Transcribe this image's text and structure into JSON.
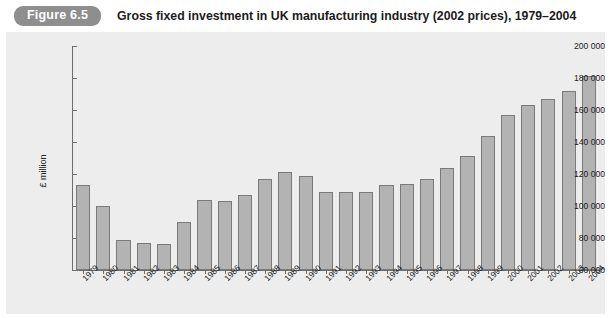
{
  "header": {
    "badge": "Figure 6.5",
    "title": "Gross fixed investment in UK manufacturing industry (2002 prices), 1979–2004"
  },
  "colors": {
    "badge_bg": "#8e8e8e",
    "panel_bg": "#ededed",
    "bar_fill": "#b3b3b3",
    "bar_border": "#7a7a7a",
    "axis": "#6e6e6e"
  },
  "chart_data": {
    "type": "bar",
    "title": "Gross fixed investment in UK manufacturing industry (2002 prices), 1979–2004",
    "xlabel": "",
    "ylabel": "£ million",
    "ylim": [
      60000,
      200000
    ],
    "ytick_labels": [
      "200 000",
      "180 000",
      "160 000",
      "140 000",
      "120 000",
      "100 000",
      "80 000",
      "60 000"
    ],
    "yticks": [
      200000,
      180000,
      160000,
      140000,
      120000,
      100000,
      80000,
      60000
    ],
    "grid": false,
    "legend": null,
    "categories": [
      "1979",
      "1980",
      "1981",
      "1982",
      "1983",
      "1984",
      "1985",
      "1986",
      "1987",
      "1988",
      "1989",
      "1990",
      "1991",
      "1992",
      "1993",
      "1994",
      "1995",
      "1996",
      "1997",
      "1998",
      "1999",
      "2000",
      "2001",
      "2002",
      "2003",
      "2004"
    ],
    "values": [
      113000,
      100000,
      79000,
      77000,
      76000,
      90000,
      104000,
      103000,
      107000,
      117000,
      121000,
      119000,
      108500,
      109000,
      108500,
      113000,
      114000,
      117000,
      124000,
      131000,
      144000,
      157000,
      163000,
      167000,
      172000,
      181000
    ]
  }
}
